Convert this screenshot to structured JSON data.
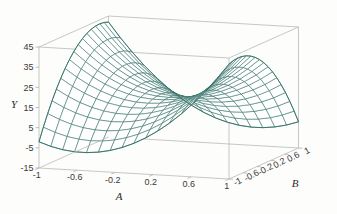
{
  "figure": {
    "kind": "3d-surface-plot",
    "background_color": "#fdfdfc",
    "box_line_color": "#b9b9b9",
    "mesh_line_color": "#2f6e64",
    "mesh_fill_color": "#ffffff",
    "tick_label_color": "#3a3a3a",
    "axis_title_color": "#2b2b2b"
  },
  "chart_data": {
    "type": "line",
    "subtype": "surface-wireframe-3d",
    "title": "",
    "xlabel": "A",
    "ylabel": "B",
    "zlabel": "Y",
    "grid": false,
    "legend": "none",
    "projection": "3d-oblique",
    "surface_shape": "saddle (hyperbolic paraboloid)",
    "mesh_divisions": {
      "a": 16,
      "b": 16
    },
    "axes": {
      "A": {
        "label": "A",
        "min": -1,
        "max": 1,
        "ticks": [
          -1,
          -0.6,
          -0.2,
          0.2,
          0.6,
          1
        ],
        "tick_labels": [
          "-1",
          "-0.6",
          "-0.2",
          "0.2",
          "0.6",
          "1"
        ]
      },
      "B": {
        "label": "B",
        "min": -1,
        "max": 1,
        "ticks": [
          -1,
          -0.6,
          -0.2,
          0.2,
          0.6,
          1
        ],
        "tick_labels": [
          "-1",
          "-0.6",
          "-0.2",
          "0.2",
          "0.6",
          "1"
        ]
      },
      "Y": {
        "label": "Y",
        "min": -15,
        "max": 45,
        "ticks": [
          -15,
          -5,
          5,
          15,
          25,
          35,
          45
        ],
        "tick_labels": [
          "-15",
          "-5",
          "5",
          "15",
          "25",
          "35",
          "45"
        ]
      }
    },
    "surface_function": "Y = 15 + 20*A*A - 15*B*B - 22*A*B",
    "corner_values": {
      "A=-1,B=-1": 42,
      "A=-1,B=1": -2,
      "A=1,B=-1": -2,
      "A=1,B=1": 42
    },
    "note": "Saddle surface: high at opposite corners (A=-1,B=-1) and (A=1,B=1), low at (A=-1,B=1) and (A=1,B=-1)."
  }
}
